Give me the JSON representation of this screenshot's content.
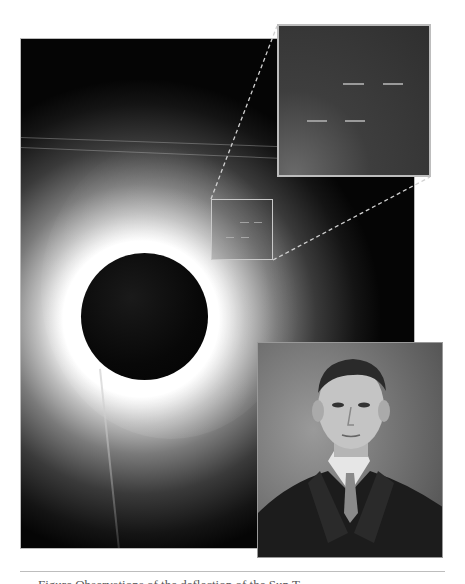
{
  "figure": {
    "main_image": {
      "subject": "total solar eclipse photograph",
      "features": [
        "dark lunar disk",
        "bright corona",
        "highlighted star region"
      ]
    },
    "highlight_box": {
      "label": "selected star field region"
    },
    "inset": {
      "subject": "magnified star field",
      "star_marks": 4
    },
    "portrait": {
      "subject": "portrait photograph of a man in suit and tie"
    },
    "caption": {
      "text": "Figure      Observations of the      deflection of the Sun             T"
    }
  },
  "colors": {
    "background": "#ffffff",
    "photo_dark": "#050505",
    "frame": "#c9c9c9",
    "divider": "#bdbdbd"
  }
}
